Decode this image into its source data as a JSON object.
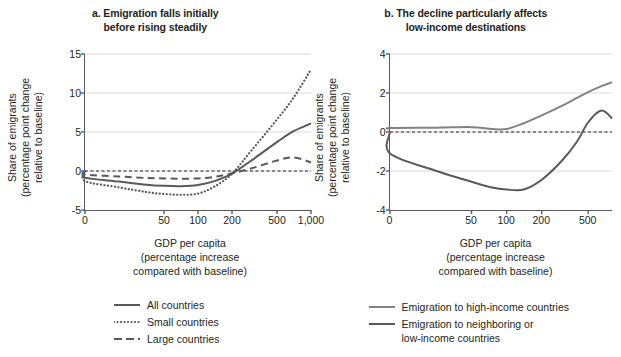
{
  "chart_data": [
    {
      "id": "panel-a",
      "type": "line",
      "title": "a. Emigration falls initially before rising steadily",
      "title_lines": [
        "a. Emigration falls initially",
        "before rising steadily"
      ],
      "xlabel": "GDP per capita (percentage increase compared with baseline)",
      "xlabel_lines": [
        "GDP per capita",
        "(percentage increase",
        "compared with baseline)"
      ],
      "ylabel": "Share of emigrants (percentage point change relative to baseline)",
      "ylabel_lines": [
        "Share of emigrants",
        "(percentage point change",
        "relative to baseline)"
      ],
      "xscale": "log",
      "xticks": [
        0,
        50,
        100,
        200,
        500,
        1000
      ],
      "xticklabels": [
        "0",
        "50",
        "100",
        "200",
        "500",
        "1,000"
      ],
      "yticks": [
        -5,
        0,
        5,
        10,
        15
      ],
      "yticklabels": [
        "-5",
        "0",
        "5",
        "10",
        "15"
      ],
      "ylim": [
        -5,
        15
      ],
      "grid": "horizontal",
      "zero_reference_line": true,
      "legend_position": "bottom",
      "series": [
        {
          "name": "All countries",
          "style": "solid",
          "color": "#58595b",
          "x": [
            0,
            10,
            20,
            35,
            50,
            70,
            100,
            140,
            200,
            300,
            500,
            700,
            1000
          ],
          "values": [
            0,
            -0.85,
            -1.35,
            -1.75,
            -1.9,
            -1.95,
            -1.8,
            -1.3,
            -0.35,
            1.4,
            3.7,
            5.1,
            6.1
          ]
        },
        {
          "name": "Small countries",
          "style": "dotted",
          "color": "#58595b",
          "x": [
            0,
            10,
            20,
            35,
            50,
            70,
            100,
            140,
            200,
            300,
            500,
            700,
            1000
          ],
          "values": [
            0,
            -1.3,
            -2.1,
            -2.7,
            -2.95,
            -3.05,
            -2.9,
            -2.0,
            -0.35,
            2.7,
            6.6,
            9.4,
            13.0
          ]
        },
        {
          "name": "Large countries",
          "style": "dashed",
          "color": "#58595b",
          "x": [
            0,
            10,
            20,
            35,
            50,
            70,
            100,
            140,
            200,
            300,
            500,
            700,
            1000
          ],
          "values": [
            0,
            -0.45,
            -0.7,
            -0.9,
            -0.95,
            -1.0,
            -0.95,
            -0.75,
            -0.3,
            0.35,
            1.35,
            1.75,
            1.1
          ]
        }
      ]
    },
    {
      "id": "panel-b",
      "type": "line",
      "title": "b. The decline particularly affects low-income destinations",
      "title_lines": [
        "b. The decline particularly affects",
        "low-income destinations"
      ],
      "xlabel": "GDP per capita (percentage increase compared with baseline)",
      "xlabel_lines": [
        "GDP per capita",
        "(percentage increase",
        "compared with baseline)"
      ],
      "ylabel": "Share of emigrants (percentage point change relative to baseline)",
      "ylabel_lines": [
        "Share of emigrants",
        "(percentage point change",
        "relative to baseline)"
      ],
      "xscale": "log",
      "xticks": [
        0,
        50,
        100,
        200,
        500
      ],
      "xticklabels": [
        "0",
        "50",
        "100",
        "200",
        "500"
      ],
      "yticks": [
        -4,
        -2,
        0,
        2,
        4
      ],
      "yticklabels": [
        "-4",
        "-2",
        "0",
        "2",
        "4"
      ],
      "ylim": [
        -4,
        4
      ],
      "grid": "horizontal",
      "zero_reference_line": true,
      "legend_position": "bottom",
      "series": [
        {
          "name": "Emigration to high-income countries",
          "style": "solid",
          "color": "#808285",
          "x": [
            0,
            10,
            25,
            50,
            75,
            100,
            140,
            200,
            300,
            400,
            500,
            650,
            800
          ],
          "values": [
            0.15,
            0.2,
            0.22,
            0.25,
            0.15,
            0.15,
            0.45,
            0.85,
            1.35,
            1.75,
            2.05,
            2.35,
            2.55
          ]
        },
        {
          "name": "Emigration to neighboring or low-income countries",
          "style": "solid",
          "color": "#58595b",
          "x": [
            0,
            10,
            25,
            50,
            75,
            100,
            140,
            200,
            300,
            400,
            500,
            650,
            800
          ],
          "values": [
            0.0,
            -1.1,
            -2.0,
            -2.55,
            -2.85,
            -2.95,
            -2.95,
            -2.45,
            -1.45,
            -0.5,
            0.5,
            1.1,
            0.7
          ]
        }
      ]
    }
  ],
  "panel_a": {
    "legend": [
      {
        "label": "All countries",
        "style": "solid"
      },
      {
        "label": "Small countries",
        "style": "dotted"
      },
      {
        "label": "Large countries",
        "style": "dashed"
      }
    ]
  },
  "panel_b": {
    "legend": [
      {
        "label": "Emigration to high-income countries",
        "lines": [
          "Emigration to high-income countries"
        ],
        "style": "solid",
        "color": "#808285"
      },
      {
        "label": "Emigration to neighboring or low-income countries",
        "lines": [
          "Emigration to neighboring or",
          "low-income countries"
        ],
        "style": "solid",
        "color": "#58595b"
      }
    ]
  },
  "colors": {
    "dark_gray": "#58595b",
    "mid_gray": "#808285",
    "grid": "#d9d9d9",
    "axis": "#58595b",
    "text": "#231f20"
  }
}
